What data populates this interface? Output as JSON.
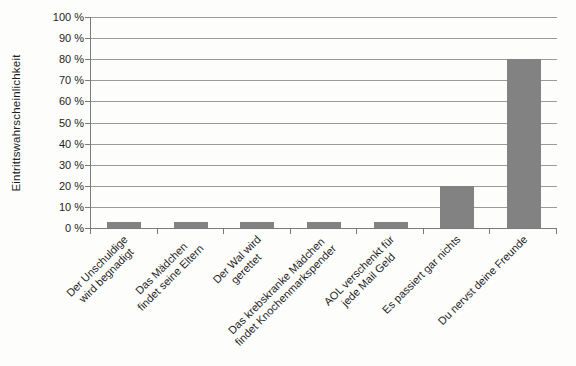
{
  "chart_data": {
    "type": "bar",
    "title": "",
    "xlabel": "",
    "ylabel": "Eintrittswahrscheinlichkeit",
    "categories": [
      "Der Unschuldige\nwird begnadigt",
      "Das Mädchen\nfindet seine Eltern",
      "Der Wal wird\ngerettet",
      "Das krebskranke Mädchen\nfindet Knochenmarkspender",
      "AOL verschenkt für\njede Mail Geld",
      "Es passiert gar nichts",
      "Du nervst deine Freunde"
    ],
    "values": [
      3,
      3,
      3,
      3,
      3,
      20,
      80
    ],
    "ylim": [
      0,
      100
    ],
    "ytick_step": 10,
    "ytick_labels": [
      "0 %",
      "10 %",
      "20 %",
      "30 %",
      "40 %",
      "50 %",
      "60 %",
      "70 %",
      "80 %",
      "90 %",
      "100 %"
    ],
    "grid": true,
    "legend": "none",
    "colors": {
      "bar": "#828282",
      "gridline": "#9a9a9a",
      "axis": "#7a7a7a",
      "text": "#1d1d1d",
      "background": "#fdfdfc"
    }
  }
}
